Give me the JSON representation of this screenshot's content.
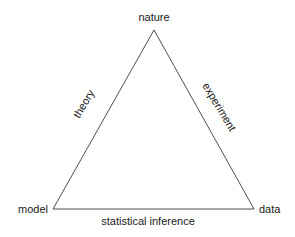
{
  "diagram": {
    "vertices": {
      "top": "nature",
      "left": "model",
      "right": "data"
    },
    "edges": {
      "left": "theory",
      "right": "experiment",
      "bottom": "statistical inference"
    },
    "colors": {
      "line": "#3a3a3a",
      "text": "#1a1a1a",
      "background": "#ffffff"
    }
  }
}
